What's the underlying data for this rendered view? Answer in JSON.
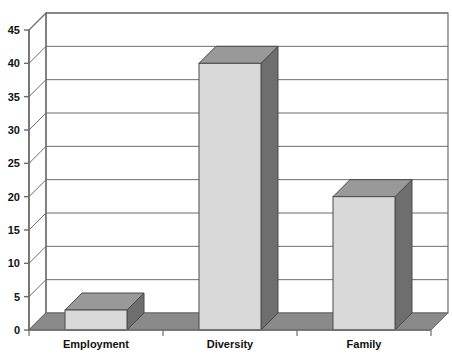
{
  "chart_data": {
    "type": "bar",
    "title": "",
    "subtitle": "",
    "xlabel": "",
    "ylabel": "",
    "categories": [
      "Employment",
      "Diversity",
      "Family"
    ],
    "values": [
      3,
      40,
      20
    ],
    "series": [
      {
        "name": "",
        "values": [
          3,
          40,
          20
        ]
      }
    ],
    "ylim": [
      0,
      45
    ],
    "ytick_labels": [
      "0",
      "5",
      "10",
      "15",
      "20",
      "25",
      "30",
      "35",
      "40",
      "45"
    ],
    "ytick_values": [
      0,
      5,
      10,
      15,
      20,
      25,
      30,
      35,
      40,
      45
    ],
    "grid": true,
    "legend": "none",
    "style": "3d-column",
    "colors": {
      "bar_front": "#d9d9d9",
      "bar_side": "#6e6e6e",
      "bar_top": "#999999",
      "floor": "#8a8a8a",
      "floor_side": "#5f5f5f",
      "plot_background": "#ffffff",
      "axis": "#6b6b6b",
      "gridline": "#6b6b6b",
      "text": "#111111"
    }
  },
  "axis": {
    "y_ticks": [
      {
        "label": "45",
        "value": 45
      },
      {
        "label": "40",
        "value": 40
      },
      {
        "label": "35",
        "value": 35
      },
      {
        "label": "30",
        "value": 30
      },
      {
        "label": "25",
        "value": 25
      },
      {
        "label": "20",
        "value": 20
      },
      {
        "label": "15",
        "value": 15
      },
      {
        "label": "10",
        "value": 10
      },
      {
        "label": "5",
        "value": 5
      },
      {
        "label": "0",
        "value": 0
      }
    ],
    "x_categories": [
      {
        "label": "Employment"
      },
      {
        "label": "Diversity"
      },
      {
        "label": "Family"
      }
    ]
  }
}
